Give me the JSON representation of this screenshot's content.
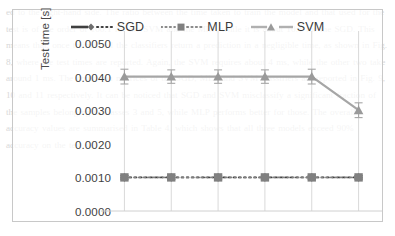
{
  "background_text": "ed to the right-hand side. The ratio between the time taken to train the model and that used for the test is of the order of 100:1 for the SVM and the MLP, while it is about 10:1 for the SGD. This means that, once trained, all the classifiers return a prediction in a negligible time, as shown in Fig. 8, where the test times are reported. Again, the SVM requires about 4 ms, while the other two take around 1 ms. The confusion matrices of the SGD, MLP and SVM classifiers are reported in Fig. 9, 10 and 11 respectively. It can be noticed that SGD and SVM misclassify a significant fraction of the samples belonging to classes 3 and 5, while MLP performs better for those. The overall accuracy values are summarised in Table 4, which shows that all three models exceed 90% accuracy on the test set.",
  "figure": {
    "legend": [
      {
        "label": "SGD",
        "color": "#3f3f3f",
        "marker": "diamond",
        "line_style": "solid-dotted"
      },
      {
        "label": "MLP",
        "color": "#808080",
        "marker": "square",
        "line_style": "dotted"
      },
      {
        "label": "SVM",
        "color": "#a6a6a6",
        "marker": "triangle",
        "line_style": "dashed"
      }
    ]
  },
  "chart_data": {
    "type": "line",
    "title": "",
    "xlabel": "",
    "ylabel": "Test time [s]",
    "ylim": [
      0.0,
      0.005
    ],
    "ytick_labels": [
      "0.0000",
      "0.0010",
      "0.0020",
      "0.0030",
      "0.0040",
      "0.0050"
    ],
    "ytick_values": [
      0.0,
      0.001,
      0.002,
      0.003,
      0.004,
      0.005
    ],
    "x": [
      1,
      2,
      3,
      4,
      5,
      6
    ],
    "xtick_labels": [
      "",
      "",
      "",
      "",
      "",
      ""
    ],
    "grid": "vertical",
    "legend_position": "top-center",
    "series": [
      {
        "name": "SGD",
        "color": "#3f3f3f",
        "marker": "diamond",
        "line_style": "solid-dotted",
        "values": [
          0.001,
          0.001,
          0.001,
          0.001,
          0.001,
          0.001
        ],
        "errors": [
          5e-05,
          5e-05,
          5e-05,
          5e-05,
          5e-05,
          5e-05
        ]
      },
      {
        "name": "MLP",
        "color": "#808080",
        "marker": "square",
        "line_style": "dotted",
        "values": [
          0.001,
          0.001,
          0.001,
          0.001,
          0.001,
          0.001
        ],
        "errors": [
          5e-05,
          5e-05,
          5e-05,
          5e-05,
          5e-05,
          5e-05
        ]
      },
      {
        "name": "SVM",
        "color": "#a6a6a6",
        "marker": "triangle",
        "line_style": "dashed",
        "values": [
          0.004,
          0.004,
          0.004,
          0.004,
          0.004,
          0.003
        ],
        "errors": [
          0.00022,
          0.0002,
          0.0002,
          0.0002,
          0.00022,
          0.00022
        ]
      }
    ]
  }
}
